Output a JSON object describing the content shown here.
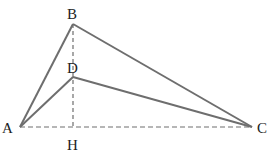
{
  "figure": {
    "type": "geometry-diagram",
    "points": {
      "A": {
        "label": "A",
        "x": 20,
        "y": 127
      },
      "B": {
        "label": "B",
        "x": 73,
        "y": 24
      },
      "C": {
        "label": "C",
        "x": 252,
        "y": 127
      },
      "D": {
        "label": "D",
        "x": 73,
        "y": 77
      },
      "H": {
        "label": "H",
        "x": 73,
        "y": 127
      }
    },
    "solid_segments": [
      "AB",
      "BC",
      "AD",
      "DC"
    ],
    "dashed_segments": [
      "AC",
      "BH"
    ],
    "colors": {
      "line": "#6e6e6e",
      "text": "#222222",
      "background": "#ffffff"
    }
  }
}
